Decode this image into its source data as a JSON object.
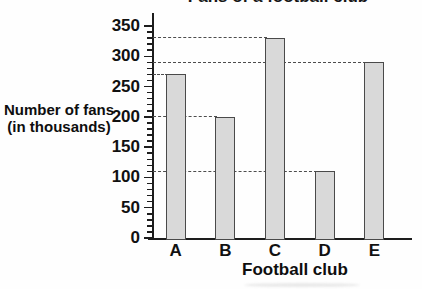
{
  "title": "Fans of a football club",
  "y_axis": {
    "label_line1": "Number of fans",
    "label_line2": "(in thousands)",
    "tick_labels": [
      "0",
      "50",
      "100",
      "150",
      "200",
      "250",
      "300",
      "350"
    ]
  },
  "x_axis": {
    "label": "Football club",
    "categories": [
      "A",
      "B",
      "C",
      "D",
      "E"
    ]
  },
  "chart_data": {
    "type": "bar",
    "title": "Fans of a football club",
    "categories": [
      "A",
      "B",
      "C",
      "D",
      "E"
    ],
    "values": [
      270,
      200,
      330,
      110,
      290
    ],
    "xlabel": "Football club",
    "ylabel": "Number of fans (in thousands)",
    "ylim": [
      0,
      350
    ],
    "ytick_major_interval": 50,
    "ytick_minor_interval": 10,
    "guide_lines": "dashed horizontal line from y-axis to the top of each bar",
    "legend": "none"
  },
  "colors": {
    "background": "#fefefe",
    "bar_fill": "#d9d9d9",
    "bar_border": "#4a4a4a",
    "axis": "#1d1d1d",
    "dashed_line": "#4d4d4d",
    "text": "#111111"
  }
}
